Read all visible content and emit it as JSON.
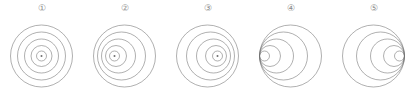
{
  "figure": {
    "background_color": "#ffffff",
    "stroke_color": "#6e6e6e",
    "label_color": "#8a8a8a",
    "panel_count": 5,
    "panel_width": 83,
    "panel_height": 100,
    "canvas_width": 83,
    "canvas_height": 80
  },
  "chart_data": {
    "type": "diagram",
    "panels": [
      {
        "label": "①",
        "index": 1,
        "outer_radius": 31,
        "outer_center_x": 41.5,
        "outer_center_y": 40,
        "circles": [
          {
            "r": 31,
            "cx": 41.5,
            "cy": 40
          },
          {
            "r": 24,
            "cx": 41.5,
            "cy": 40
          },
          {
            "r": 17,
            "cx": 41.5,
            "cy": 40
          },
          {
            "r": 10.5,
            "cx": 41.5,
            "cy": 40
          },
          {
            "r": 5,
            "cx": 41.5,
            "cy": 40
          }
        ],
        "center_dot": {
          "cx": 41.5,
          "cy": 40,
          "r": 1
        },
        "has_center_dot": true,
        "eccentricity": 0.0,
        "offset_direction": "none"
      },
      {
        "label": "②",
        "index": 2,
        "outer_radius": 31,
        "outer_center_x": 41.5,
        "outer_center_y": 40,
        "circles": [
          {
            "r": 31,
            "cx": 41.5,
            "cy": 40
          },
          {
            "r": 24,
            "cx": 38.5,
            "cy": 40
          },
          {
            "r": 17,
            "cx": 35.5,
            "cy": 40
          },
          {
            "r": 10.5,
            "cx": 33,
            "cy": 40
          },
          {
            "r": 5,
            "cx": 31.5,
            "cy": 40
          }
        ],
        "center_dot": {
          "cx": 31.5,
          "cy": 40,
          "r": 1
        },
        "has_center_dot": true,
        "eccentricity": 0.32,
        "offset_direction": "left"
      },
      {
        "label": "③",
        "index": 3,
        "outer_radius": 31,
        "outer_center_x": 41.5,
        "outer_center_y": 40,
        "circles": [
          {
            "r": 31,
            "cx": 41.5,
            "cy": 40
          },
          {
            "r": 24,
            "cx": 44.5,
            "cy": 40
          },
          {
            "r": 17,
            "cx": 47.5,
            "cy": 40
          },
          {
            "r": 10.5,
            "cx": 50,
            "cy": 40
          },
          {
            "r": 5,
            "cx": 51.5,
            "cy": 40
          }
        ],
        "center_dot": {
          "cx": 51.5,
          "cy": 40,
          "r": 1
        },
        "has_center_dot": true,
        "eccentricity": 0.32,
        "offset_direction": "right"
      },
      {
        "label": "④",
        "index": 4,
        "outer_radius": 31,
        "outer_center_x": 41.5,
        "outer_center_y": 40,
        "circles": [
          {
            "r": 31,
            "cx": 41.5,
            "cy": 40
          },
          {
            "r": 24,
            "cx": 34.5,
            "cy": 40
          },
          {
            "r": 17,
            "cx": 27.5,
            "cy": 40
          },
          {
            "r": 10.5,
            "cx": 21,
            "cy": 40
          },
          {
            "r": 5,
            "cx": 15.5,
            "cy": 40
          }
        ],
        "center_dot": null,
        "has_center_dot": false,
        "eccentricity": 1.0,
        "offset_direction": "left-tangent"
      },
      {
        "label": "⑤",
        "index": 5,
        "outer_radius": 31,
        "outer_center_x": 41.5,
        "outer_center_y": 40,
        "circles": [
          {
            "r": 31,
            "cx": 41.5,
            "cy": 40
          },
          {
            "r": 24,
            "cx": 48.5,
            "cy": 40
          },
          {
            "r": 17,
            "cx": 55.5,
            "cy": 40
          },
          {
            "r": 10.5,
            "cx": 62,
            "cy": 40
          },
          {
            "r": 5,
            "cx": 67.5,
            "cy": 40
          }
        ],
        "center_dot": null,
        "has_center_dot": false,
        "eccentricity": 1.0,
        "offset_direction": "right-tangent"
      }
    ]
  }
}
